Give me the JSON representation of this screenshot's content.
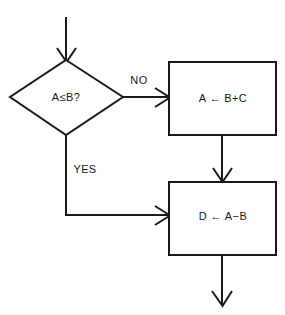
{
  "diagram": {
    "type": "flowchart",
    "background_color": "#ffffff",
    "line_color": "#1a1a1a",
    "nodes": {
      "decision": {
        "shape": "diamond",
        "text": "A≤B?"
      },
      "process_no": {
        "shape": "rectangle",
        "text": "A ← B+C"
      },
      "process_join": {
        "shape": "rectangle",
        "text": "D ← A−B"
      }
    },
    "edges": {
      "entry": {
        "label": "",
        "from": "start",
        "to": "decision"
      },
      "no_branch": {
        "label": "NO",
        "from": "decision",
        "to": "process_no"
      },
      "yes_branch": {
        "label": "YES",
        "from": "decision",
        "to": "process_join"
      },
      "sequence": {
        "label": "",
        "from": "process_no",
        "to": "process_join"
      },
      "exit": {
        "label": "",
        "from": "process_join",
        "to": "end"
      }
    }
  }
}
